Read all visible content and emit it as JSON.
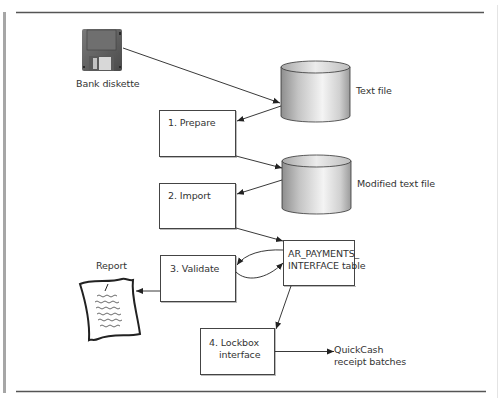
{
  "diagram": {
    "frame": {
      "rule_color": "#555555",
      "side_bar_color": "#a0a0a0"
    },
    "nodes": {
      "diskette": {
        "label": "Bank diskette",
        "icon": "floppy-disk-icon"
      },
      "text_file": {
        "label": "Text file",
        "icon": "database-cylinder-icon"
      },
      "prepare": {
        "label": "1. Prepare"
      },
      "modified_text_file": {
        "label": "Modified text file",
        "icon": "database-cylinder-icon"
      },
      "import": {
        "label": "2. Import"
      },
      "interface_table": {
        "label_line1": "AR_PAYMENTS_",
        "label_line2": "INTERFACE table"
      },
      "validate": {
        "label": "3. Validate"
      },
      "report": {
        "label": "Report",
        "icon": "document-report-icon"
      },
      "lockbox": {
        "label_line1": "4. Lockbox",
        "label_line2": "interface"
      },
      "quickcash": {
        "label_line1": "QuickCash",
        "label_line2": "receipt batches"
      }
    },
    "edges": [
      {
        "from": "Bank diskette",
        "to": "Text file"
      },
      {
        "from": "Text file",
        "to": "1. Prepare"
      },
      {
        "from": "1. Prepare",
        "to": "Modified text file"
      },
      {
        "from": "Modified text file",
        "to": "2. Import"
      },
      {
        "from": "2. Import",
        "to": "AR_PAYMENTS_INTERFACE table"
      },
      {
        "from": "AR_PAYMENTS_INTERFACE table",
        "to": "3. Validate"
      },
      {
        "from": "3. Validate",
        "to": "AR_PAYMENTS_INTERFACE table"
      },
      {
        "from": "3. Validate",
        "to": "Report"
      },
      {
        "from": "AR_PAYMENTS_INTERFACE table",
        "to": "4. Lockbox interface"
      },
      {
        "from": "4. Lockbox interface",
        "to": "QuickCash receipt batches"
      }
    ]
  }
}
